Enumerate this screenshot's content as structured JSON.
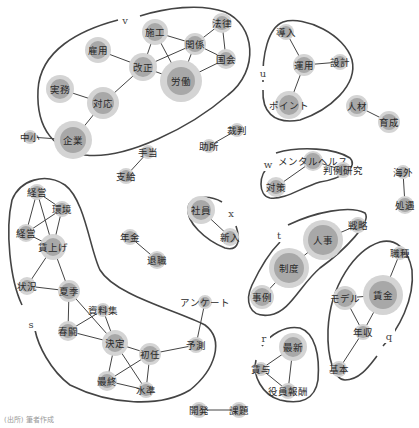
{
  "diagram": {
    "type": "co-occurrence-network",
    "colors": {
      "node_inner": "#a8a8a8",
      "node_outer": "#d4d4d4",
      "edge": "#444444",
      "hull": "#444444",
      "text": "#2a2a2a"
    },
    "groups": [
      {
        "id": "v",
        "label": "v",
        "lx": 125,
        "ly": 20
      },
      {
        "id": "u",
        "label": "u",
        "lx": 263,
        "ly": 73
      },
      {
        "id": "w",
        "label": "w",
        "lx": 268,
        "ly": 164
      },
      {
        "id": "x",
        "label": "x",
        "lx": 231,
        "ly": 213
      },
      {
        "id": "t",
        "label": "t",
        "lx": 279,
        "ly": 235
      },
      {
        "id": "s",
        "label": "s",
        "lx": 31,
        "ly": 324
      },
      {
        "id": "r",
        "label": "r",
        "lx": 264,
        "ly": 338
      },
      {
        "id": "q",
        "label": "q",
        "lx": 389,
        "ly": 336
      }
    ],
    "nodes": [
      {
        "id": "施工",
        "x": 155,
        "y": 32,
        "r": 9,
        "rr": 13
      },
      {
        "id": "法律",
        "x": 222,
        "y": 23,
        "r": 7,
        "rr": 10
      },
      {
        "id": "雇用",
        "x": 98,
        "y": 50,
        "r": 9,
        "rr": 13
      },
      {
        "id": "関係",
        "x": 195,
        "y": 44,
        "r": 8,
        "rr": 11
      },
      {
        "id": "改正",
        "x": 143,
        "y": 67,
        "r": 10,
        "rr": 14
      },
      {
        "id": "国会",
        "x": 226,
        "y": 59,
        "r": 7,
        "rr": 10
      },
      {
        "id": "労働",
        "x": 181,
        "y": 81,
        "r": 14,
        "rr": 21
      },
      {
        "id": "実務",
        "x": 60,
        "y": 89,
        "r": 10,
        "rr": 14
      },
      {
        "id": "対応",
        "x": 103,
        "y": 103,
        "r": 11,
        "rr": 16
      },
      {
        "id": "企業",
        "x": 73,
        "y": 140,
        "r": 13,
        "rr": 19
      },
      {
        "id": "中小",
        "x": 30,
        "y": 137,
        "r": 5,
        "rr": 7
      },
      {
        "id": "導入",
        "x": 286,
        "y": 32,
        "r": 6,
        "rr": 8
      },
      {
        "id": "運用",
        "x": 304,
        "y": 65,
        "r": 8,
        "rr": 11
      },
      {
        "id": "設計",
        "x": 340,
        "y": 62,
        "r": 6,
        "rr": 8
      },
      {
        "id": "ポイント",
        "x": 289,
        "y": 105,
        "r": 10,
        "rr": 14
      },
      {
        "id": "人材",
        "x": 357,
        "y": 106,
        "r": 8,
        "rr": 11
      },
      {
        "id": "育成",
        "x": 389,
        "y": 122,
        "r": 8,
        "rr": 11
      },
      {
        "id": "裁判",
        "x": 237,
        "y": 130,
        "r": 5,
        "rr": 7
      },
      {
        "id": "助所",
        "x": 209,
        "y": 146,
        "r": 5,
        "rr": 7
      },
      {
        "id": "手当",
        "x": 148,
        "y": 152,
        "r": 5,
        "rr": 7
      },
      {
        "id": "支給",
        "x": 126,
        "y": 176,
        "r": 6,
        "rr": 8
      },
      {
        "id": "メンタルヘルス",
        "x": 313,
        "y": 161,
        "r": 8,
        "rr": 10
      },
      {
        "id": "判例研究",
        "x": 343,
        "y": 170,
        "r": 6,
        "rr": 8
      },
      {
        "id": "対策",
        "x": 276,
        "y": 187,
        "r": 7,
        "rr": 10
      },
      {
        "id": "海外",
        "x": 403,
        "y": 172,
        "r": 5,
        "rr": 7
      },
      {
        "id": "処遇",
        "x": 405,
        "y": 205,
        "r": 7,
        "rr": 9
      },
      {
        "id": "経営",
        "x": 37,
        "y": 192,
        "r": 6,
        "rr": 8
      },
      {
        "id": "環境",
        "x": 62,
        "y": 209,
        "r": 6,
        "rr": 8
      },
      {
        "id": "経営2",
        "label": "経営",
        "x": 26,
        "y": 233,
        "r": 7,
        "rr": 9
      },
      {
        "id": "賃上げ",
        "x": 53,
        "y": 247,
        "r": 9,
        "rr": 13
      },
      {
        "id": "社員",
        "x": 201,
        "y": 210,
        "r": 10,
        "rr": 14
      },
      {
        "id": "新入",
        "x": 230,
        "y": 237,
        "r": 6,
        "rr": 9
      },
      {
        "id": "人事",
        "x": 323,
        "y": 240,
        "r": 15,
        "rr": 20
      },
      {
        "id": "戦略",
        "x": 358,
        "y": 225,
        "r": 6,
        "rr": 8
      },
      {
        "id": "制度",
        "x": 289,
        "y": 268,
        "r": 15,
        "rr": 20
      },
      {
        "id": "年金",
        "x": 130,
        "y": 237,
        "r": 6,
        "rr": 8
      },
      {
        "id": "退職",
        "x": 157,
        "y": 260,
        "r": 7,
        "rr": 9
      },
      {
        "id": "職種",
        "x": 400,
        "y": 253,
        "r": 5,
        "rr": 7
      },
      {
        "id": "事例",
        "x": 262,
        "y": 297,
        "r": 9,
        "rr": 12
      },
      {
        "id": "モデル",
        "x": 345,
        "y": 298,
        "r": 9,
        "rr": 12
      },
      {
        "id": "賃金",
        "x": 383,
        "y": 295,
        "r": 14,
        "rr": 20
      },
      {
        "id": "状況",
        "x": 27,
        "y": 286,
        "r": 6,
        "rr": 9
      },
      {
        "id": "夏季",
        "x": 69,
        "y": 291,
        "r": 8,
        "rr": 11
      },
      {
        "id": "資料集",
        "x": 103,
        "y": 310,
        "r": 5,
        "rr": 7
      },
      {
        "id": "アンケート",
        "x": 205,
        "y": 302,
        "r": 5,
        "rr": 7
      },
      {
        "id": "年収",
        "x": 363,
        "y": 332,
        "r": 6,
        "rr": 8
      },
      {
        "id": "春闘",
        "x": 68,
        "y": 331,
        "r": 7,
        "rr": 10
      },
      {
        "id": "決定",
        "x": 115,
        "y": 343,
        "r": 9,
        "rr": 13
      },
      {
        "id": "初任",
        "x": 150,
        "y": 354,
        "r": 8,
        "rr": 11
      },
      {
        "id": "予測",
        "x": 196,
        "y": 345,
        "r": 6,
        "rr": 8
      },
      {
        "id": "最新",
        "x": 293,
        "y": 347,
        "r": 10,
        "rr": 14
      },
      {
        "id": "賃与",
        "x": 261,
        "y": 369,
        "r": 5,
        "rr": 7
      },
      {
        "id": "基本",
        "x": 339,
        "y": 369,
        "r": 6,
        "rr": 8
      },
      {
        "id": "最終",
        "x": 107,
        "y": 381,
        "r": 7,
        "rr": 10
      },
      {
        "id": "水準",
        "x": 146,
        "y": 390,
        "r": 6,
        "rr": 8
      },
      {
        "id": "役員報酬",
        "x": 288,
        "y": 391,
        "r": 6,
        "rr": 8
      },
      {
        "id": "開発",
        "x": 199,
        "y": 410,
        "r": 6,
        "rr": 8
      },
      {
        "id": "課題",
        "x": 239,
        "y": 410,
        "r": 6,
        "rr": 8
      }
    ],
    "edges": [
      [
        "施工",
        "関係"
      ],
      [
        "施工",
        "改正"
      ],
      [
        "施工",
        "労働"
      ],
      [
        "法律",
        "関係"
      ],
      [
        "法律",
        "国会"
      ],
      [
        "関係",
        "改正"
      ],
      [
        "関係",
        "労働"
      ],
      [
        "関係",
        "国会"
      ],
      [
        "国会",
        "労働"
      ],
      [
        "雇用",
        "改正"
      ],
      [
        "改正",
        "労働"
      ],
      [
        "改正",
        "対応"
      ],
      [
        "実務",
        "対応"
      ],
      [
        "対応",
        "企業"
      ],
      [
        "中小",
        "企業"
      ],
      [
        "導入",
        "運用"
      ],
      [
        "運用",
        "設計"
      ],
      [
        "運用",
        "ポイント"
      ],
      [
        "人材",
        "育成"
      ],
      [
        "裁判",
        "助所"
      ],
      [
        "手当",
        "支給"
      ],
      [
        "メンタルヘルス",
        "判例研究"
      ],
      [
        "メンタルヘルス",
        "対策"
      ],
      [
        "海外",
        "処遇"
      ],
      [
        "経営",
        "環境"
      ],
      [
        "経営",
        "経営2"
      ],
      [
        "経営",
        "賃上げ"
      ],
      [
        "環境",
        "経営2"
      ],
      [
        "環境",
        "賃上げ"
      ],
      [
        "経営2",
        "賃上げ"
      ],
      [
        "賃上げ",
        "状況"
      ],
      [
        "賃上げ",
        "夏季"
      ],
      [
        "社員",
        "新入"
      ],
      [
        "人事",
        "戦略"
      ],
      [
        "人事",
        "制度"
      ],
      [
        "制度",
        "事例"
      ],
      [
        "年金",
        "退職"
      ],
      [
        "職種",
        "賃金"
      ],
      [
        "モデル",
        "賃金"
      ],
      [
        "モデル",
        "年収"
      ],
      [
        "賃金",
        "年収"
      ],
      [
        "年収",
        "基本"
      ],
      [
        "状況",
        "夏季"
      ],
      [
        "夏季",
        "春闘"
      ],
      [
        "夏季",
        "決定"
      ],
      [
        "資料集",
        "春闘"
      ],
      [
        "資料集",
        "決定"
      ],
      [
        "春闘",
        "決定"
      ],
      [
        "決定",
        "初任"
      ],
      [
        "決定",
        "最終"
      ],
      [
        "決定",
        "水準"
      ],
      [
        "初任",
        "予測"
      ],
      [
        "初任",
        "最終"
      ],
      [
        "初任",
        "水準"
      ],
      [
        "最終",
        "水準"
      ],
      [
        "アンケート",
        "予測"
      ],
      [
        "最新",
        "賃与"
      ],
      [
        "最新",
        "役員報酬"
      ],
      [
        "賃与",
        "役員報酬"
      ],
      [
        "開発",
        "課題"
      ]
    ]
  },
  "footer": {
    "text": "(出所) 筆者作成"
  }
}
